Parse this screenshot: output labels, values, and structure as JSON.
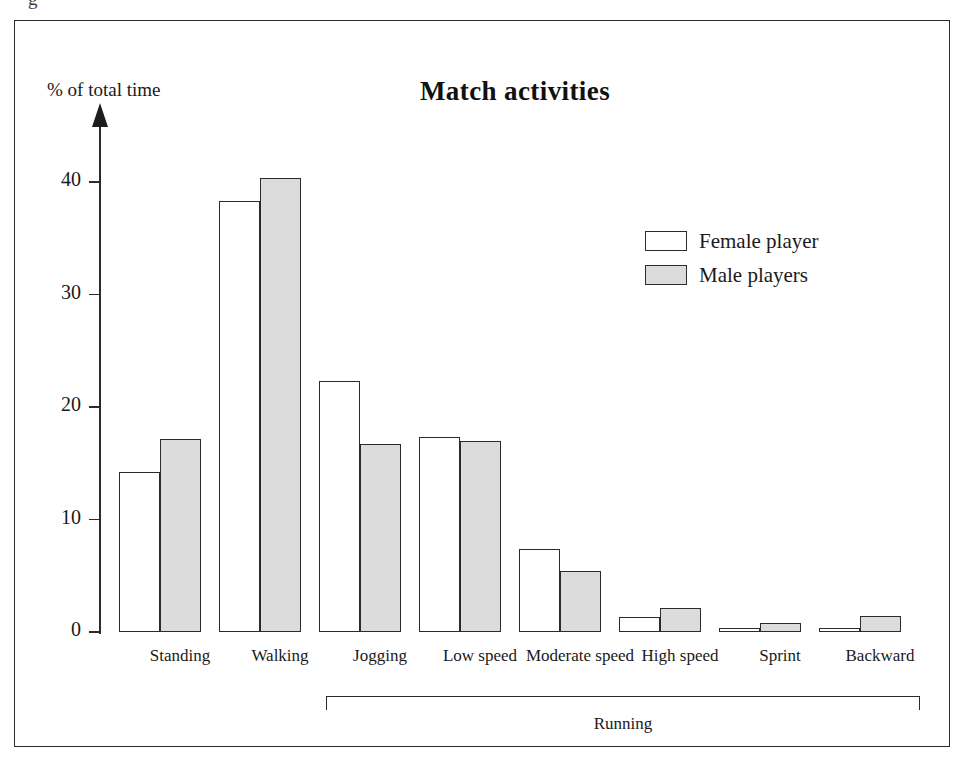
{
  "figure": {
    "top_remnant": "g",
    "axis_title": "% of total time",
    "group_bracket_label": "Running"
  },
  "legend": {
    "items": [
      {
        "label": "Female player",
        "swatch": "white-square-icon",
        "color": "#ffffff"
      },
      {
        "label": "Male players",
        "swatch": "gray-square-icon",
        "color": "#dcdcdc"
      }
    ]
  },
  "chart_data": {
    "type": "bar",
    "title": "Match activities",
    "xlabel": "",
    "ylabel": "% of total time",
    "ylim": [
      0,
      44
    ],
    "yticks": [
      0,
      10,
      20,
      30,
      40
    ],
    "ytick_labels": [
      "0",
      "10",
      "20",
      "30",
      "40"
    ],
    "grid": false,
    "legend_position": "upper right",
    "categories": [
      "Standing",
      "Walking",
      "Jogging",
      "Low speed",
      "Moderate speed",
      "High speed",
      "Sprint",
      "Backward"
    ],
    "group_bracket": {
      "label": "Running",
      "covers": [
        "Jogging",
        "Low speed",
        "Moderate speed",
        "High speed",
        "Sprint",
        "Backward"
      ]
    },
    "series": [
      {
        "name": "Female player",
        "color": "#ffffff",
        "values": [
          14.2,
          38.3,
          22.3,
          17.3,
          7.4,
          1.3,
          0.3,
          0.3
        ]
      },
      {
        "name": "Male players",
        "color": "#dcdcdc",
        "values": [
          17.2,
          40.4,
          16.7,
          17.0,
          5.4,
          2.1,
          0.8,
          1.4
        ]
      }
    ]
  }
}
